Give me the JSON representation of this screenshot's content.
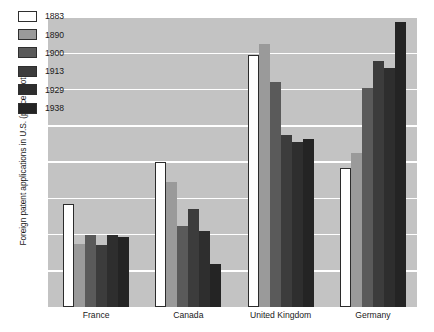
{
  "chart_data": {
    "type": "bar",
    "title": "",
    "subtitle": "",
    "xlabel": "",
    "ylabel": "Foreign patent applications in U.S. (percent total)",
    "categories": [
      "France",
      "Canada",
      "United Kingdom",
      "Germany"
    ],
    "series": [
      {
        "name": "1883",
        "color": "#ffffff",
        "values": [
          14.2,
          20.0,
          34.7,
          19.2
        ]
      },
      {
        "name": "1890",
        "color": "#9a9a9a",
        "values": [
          8.7,
          17.2,
          36.3,
          21.2
        ]
      },
      {
        "name": "1900",
        "color": "#5a5a5a",
        "values": [
          10.0,
          11.2,
          31.0,
          30.2
        ]
      },
      {
        "name": "1913",
        "color": "#3c3c3c",
        "values": [
          8.5,
          13.5,
          23.7,
          34.0
        ]
      },
      {
        "name": "1929",
        "color": "#2e2e2e",
        "values": [
          10.0,
          10.5,
          22.7,
          33.0
        ]
      },
      {
        "name": "1938",
        "color": "#242424",
        "values": [
          9.6,
          6.0,
          23.2,
          39.3
        ]
      }
    ],
    "ylim": [
      0,
      40
    ],
    "yticks": [
      0,
      5,
      10,
      15,
      20,
      25,
      30,
      35,
      40
    ],
    "ytick_labels": [
      "0",
      "5",
      "10",
      "15",
      "20",
      "25",
      "30",
      "35",
      "40"
    ],
    "grid": true,
    "grid_color": "#ffffff",
    "plot_background": "#c3c3c3",
    "legend_position": "top-left",
    "legend_entries": [
      "1883",
      "1890",
      "1900",
      "1913",
      "1929",
      "1938"
    ]
  }
}
